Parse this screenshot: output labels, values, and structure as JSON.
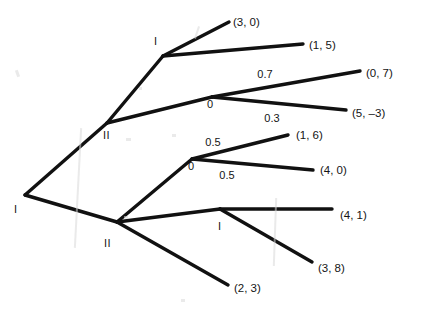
{
  "diagram": {
    "type": "extensive-form-game-tree",
    "title": "",
    "background_color": "#ffffff",
    "line_color": "#111111",
    "text_color": "#141414",
    "nodes": [
      {
        "id": "root",
        "label": "I",
        "kind": "player",
        "x": 25,
        "y": 195,
        "label_x": 14,
        "label_y": 204
      },
      {
        "id": "upper2",
        "label": "II",
        "kind": "player",
        "x": 107,
        "y": 123,
        "label_x": 103,
        "label_y": 130
      },
      {
        "id": "top1",
        "label": "I",
        "kind": "player",
        "x": 163,
        "y": 56,
        "label_x": 154,
        "label_y": 36
      },
      {
        "id": "chance1",
        "label": "0",
        "kind": "chance",
        "x": 212,
        "y": 97,
        "label_x": 207,
        "label_y": 99
      },
      {
        "id": "lower2",
        "label": "II",
        "kind": "player",
        "x": 117,
        "y": 222,
        "label_x": 104,
        "label_y": 238
      },
      {
        "id": "chance2",
        "label": "0",
        "kind": "chance",
        "x": 192,
        "y": 159,
        "label_x": 188,
        "label_y": 161
      },
      {
        "id": "bottom1",
        "label": "I",
        "kind": "player",
        "x": 220,
        "y": 209,
        "label_x": 218,
        "label_y": 221
      }
    ],
    "branches": [
      {
        "id": "root-upper2",
        "from": "root",
        "to": "upper2",
        "x1": 25,
        "y1": 195,
        "x2": 107,
        "y2": 123
      },
      {
        "id": "root-lower2",
        "from": "root",
        "to": "lower2",
        "x1": 25,
        "y1": 195,
        "x2": 117,
        "y2": 222
      },
      {
        "id": "upper2-top1",
        "from": "upper2",
        "to": "top1",
        "x1": 107,
        "y1": 123,
        "x2": 163,
        "y2": 56
      },
      {
        "id": "upper2-chance1",
        "from": "upper2",
        "to": "chance1",
        "x1": 107,
        "y1": 123,
        "x2": 212,
        "y2": 97
      },
      {
        "id": "top1-payoff30",
        "from": "top1",
        "to": "p30",
        "x1": 163,
        "y1": 56,
        "x2": 229,
        "y2": 22
      },
      {
        "id": "top1-payoff15",
        "from": "top1",
        "to": "p15",
        "x1": 163,
        "y1": 56,
        "x2": 303,
        "y2": 44
      },
      {
        "id": "chance1-payoff07",
        "from": "chance1",
        "to": "p07",
        "x1": 212,
        "y1": 97,
        "x2": 360,
        "y2": 71
      },
      {
        "id": "chance1-payoff5n3",
        "from": "chance1",
        "to": "p5n3",
        "x1": 212,
        "y1": 97,
        "x2": 346,
        "y2": 110
      },
      {
        "id": "lower2-chance2",
        "from": "lower2",
        "to": "chance2",
        "x1": 117,
        "y1": 222,
        "x2": 192,
        "y2": 159
      },
      {
        "id": "lower2-bottom1",
        "from": "lower2",
        "to": "bottom1",
        "x1": 117,
        "y1": 222,
        "x2": 220,
        "y2": 209
      },
      {
        "id": "lower2-payoff23",
        "from": "lower2",
        "to": "p23",
        "x1": 117,
        "y1": 222,
        "x2": 228,
        "y2": 285
      },
      {
        "id": "chance2-payoff16",
        "from": "chance2",
        "to": "p16",
        "x1": 192,
        "y1": 159,
        "x2": 288,
        "y2": 135
      },
      {
        "id": "chance2-payoff40",
        "from": "chance2",
        "to": "p40",
        "x1": 192,
        "y1": 159,
        "x2": 313,
        "y2": 170
      },
      {
        "id": "bottom1-payoff41",
        "from": "bottom1",
        "to": "p41",
        "x1": 220,
        "y1": 209,
        "x2": 332,
        "y2": 209
      },
      {
        "id": "bottom1-payoff38",
        "from": "bottom1",
        "to": "p38",
        "x1": 220,
        "y1": 209,
        "x2": 312,
        "y2": 262
      }
    ],
    "probabilities": [
      {
        "id": "prob-0-7",
        "value": "0.7",
        "branch": "chance1-payoff07",
        "x": 265,
        "y": 74
      },
      {
        "id": "prob-0-3",
        "value": "0.3",
        "branch": "chance1-payoff5n3",
        "x": 272,
        "y": 118
      },
      {
        "id": "prob-0-5-upper",
        "value": "0.5",
        "branch": "chance2-payoff16",
        "x": 213,
        "y": 142
      },
      {
        "id": "prob-0-5-lower",
        "value": "0.5",
        "branch": "chance2-payoff40",
        "x": 227,
        "y": 175
      }
    ],
    "payoffs": [
      {
        "id": "p30",
        "text": "(3, 0)",
        "x": 233,
        "y": 17
      },
      {
        "id": "p15",
        "text": "(1, 5)",
        "x": 309,
        "y": 40
      },
      {
        "id": "p07",
        "text": "(0, 7)",
        "x": 366,
        "y": 68
      },
      {
        "id": "p5n3",
        "text": "(5, –3)",
        "x": 352,
        "y": 108
      },
      {
        "id": "p16",
        "text": "(1, 6)",
        "x": 296,
        "y": 130
      },
      {
        "id": "p40",
        "text": "(4, 0)",
        "x": 320,
        "y": 165
      },
      {
        "id": "p41",
        "text": "(4, 1)",
        "x": 340,
        "y": 210
      },
      {
        "id": "p38",
        "text": "(3, 8)",
        "x": 318,
        "y": 263
      },
      {
        "id": "p23",
        "text": "(2, 3)",
        "x": 234,
        "y": 283
      }
    ],
    "artifacts": [
      {
        "id": "smudge-left",
        "x": 16,
        "y": 70,
        "width": 3,
        "height": 7,
        "rotate": -20
      },
      {
        "id": "smudge-mid-vert",
        "x": 77,
        "y": 128,
        "width": 2,
        "height": 120,
        "rotate": 3
      },
      {
        "id": "smudge-top-slash",
        "x": 196,
        "y": 26,
        "width": 2,
        "height": 13,
        "rotate": 18
      },
      {
        "id": "smudge-bottom-vert",
        "x": 274,
        "y": 198,
        "width": 2,
        "height": 68,
        "rotate": 2
      },
      {
        "id": "smudge-low-dot",
        "x": 126,
        "y": 138,
        "width": 5,
        "height": 3,
        "rotate": 0
      },
      {
        "id": "smudge-tiny-a",
        "x": 172,
        "y": 134,
        "width": 4,
        "height": 3,
        "rotate": 0
      },
      {
        "id": "smudge-tiny-b",
        "x": 124,
        "y": 216,
        "width": 4,
        "height": 3,
        "rotate": 0
      },
      {
        "id": "smudge-tiny-c",
        "x": 181,
        "y": 299,
        "width": 4,
        "height": 3,
        "rotate": 0
      },
      {
        "id": "smudge-tiny-d",
        "x": 139,
        "y": 87,
        "width": 3,
        "height": 3,
        "rotate": 0
      }
    ]
  }
}
